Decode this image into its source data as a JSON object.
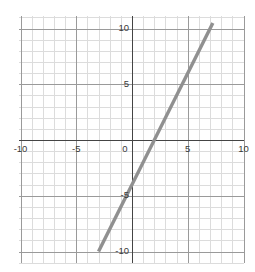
{
  "chart_data": {
    "type": "line",
    "title": "",
    "subtitle": "",
    "xlabel": "",
    "ylabel": "",
    "xlim": [
      -10.1,
      10.0
    ],
    "ylim": [
      -11.0,
      11.1
    ],
    "grid": true,
    "grid_minor_step": 1,
    "grid_major_step": 5,
    "legend": false,
    "legend_position": "none",
    "axis_color": "#444444",
    "grid_minor_color": "#dcdcdc",
    "grid_major_color": "#9a9a9a",
    "background_color": "#ffffff",
    "series": [
      {
        "name": "y = 2x - 4",
        "color": "#909090",
        "slope": 2,
        "intercept": -4,
        "x_intercept": 2,
        "y_intercept": -4,
        "x": [
          -3,
          7.25
        ],
        "values": [
          -10,
          10.5
        ],
        "segment_start": {
          "x": -3,
          "y": -10
        },
        "segment_end": {
          "x": 7.25,
          "y": 10.5
        }
      }
    ],
    "x_ticks": [
      -10,
      -5,
      0,
      5,
      10
    ],
    "x_tick_labels": [
      "-10",
      "-5",
      "0",
      "5",
      "10"
    ],
    "y_ticks": [
      10,
      5,
      0,
      -5,
      -10
    ],
    "y_tick_labels": [
      "10",
      "5",
      "0",
      "-5",
      "-10"
    ],
    "annotations": []
  }
}
